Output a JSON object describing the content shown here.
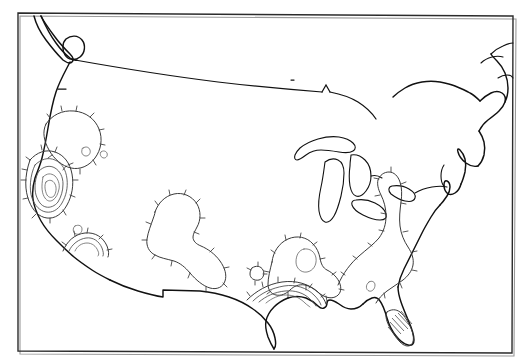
{
  "document": {
    "title": "Contour map of the contiguous United States",
    "kind": "map",
    "caption": "",
    "background_color": "#ffffff",
    "line_color": "#111111",
    "contour_color": "#3a3a3a",
    "frame_color": "#2b2b2b"
  },
  "frame": {
    "x": 18,
    "y": 13,
    "width": 495,
    "height": 340,
    "stroke_width": 1.4
  },
  "chart_data": {
    "type": "contour",
    "xlabel": "",
    "ylabel": "",
    "grid": false,
    "legend": "none",
    "projection_note": "Conic projection of the contiguous United States, curved 49th-parallel northern border",
    "contour_style": "hachured isolines (ticks point toward the enclosed center)",
    "features": [
      {
        "name": "usa-coastline",
        "role": "basemap",
        "description": "Outline of the contiguous United States including Pacific and Atlantic coasts, Gulf of Mexico, Great Lakes, Florida peninsula, Baja/Mexico border and the curved northern border with Canada"
      },
      {
        "name": "great-lakes",
        "role": "basemap",
        "description": "Lakes Superior, Michigan, Huron, Erie and Ontario drawn in outline"
      }
    ],
    "contour_sets": [
      {
        "name": "california-maximum",
        "label": "",
        "center": [
          48,
          186
        ],
        "levels": 5,
        "shape": "nested concentric closed ovals",
        "hachures": "outward ticks on outer rings",
        "region": "Central / Southern California",
        "intensity": "highest"
      },
      {
        "name": "southern-california-secondary",
        "label": "",
        "center": [
          83,
          241
        ],
        "levels": 3,
        "shape": "nested arcs opening toward the coast",
        "hachures": "ticks on the outer arc",
        "region": "Southern California coast",
        "intensity": "moderate"
      },
      {
        "name": "gulf-coast-louisiana",
        "label": "",
        "center": [
          289,
          289
        ],
        "levels": 4,
        "shape": "nested arcs following the Gulf Coast",
        "hachures": "ticks on the outer arc",
        "region": "Louisiana / northern Gulf Coast",
        "intensity": "moderate"
      },
      {
        "name": "pacific-northwest",
        "label": "",
        "center": [
          62,
          120
        ],
        "levels": 1,
        "shape": "large closed loop",
        "hachures": "inward ticks",
        "region": "Pacific Northwest / northern Great Basin",
        "intensity": "low"
      },
      {
        "name": "texas-closed-low",
        "label": "",
        "center": [
          178,
          228
        ],
        "levels": 1,
        "shape": "large closed loop with a lobe",
        "hachures": "inward ticks",
        "region": "Texas / southern Plains",
        "intensity": "low"
      },
      {
        "name": "southeast-closed-low",
        "label": "",
        "center": [
          305,
          248
        ],
        "levels": 2,
        "shape": "closed loop with interior small oval",
        "hachures": "inward ticks",
        "region": "Tennessee / Mississippi valley",
        "intensity": "low"
      },
      {
        "name": "appalachian-eastern-seaboard",
        "label": "",
        "center": [
          385,
          225
        ],
        "levels": 1,
        "shape": "elongated closed loop along the Appalachians",
        "hachures": "inward ticks",
        "region": "Appalachians / Mid-Atlantic",
        "intensity": "low"
      },
      {
        "name": "florida-hatched",
        "label": "",
        "center": [
          404,
          322
        ],
        "levels": 1,
        "shape": "hatched sliver over the Florida peninsula",
        "hachures": "parallel hatching",
        "region": "Southern Florida",
        "intensity": "low"
      }
    ]
  },
  "annotations": {
    "labels": [],
    "legend_items": [],
    "axis_ticks": []
  }
}
